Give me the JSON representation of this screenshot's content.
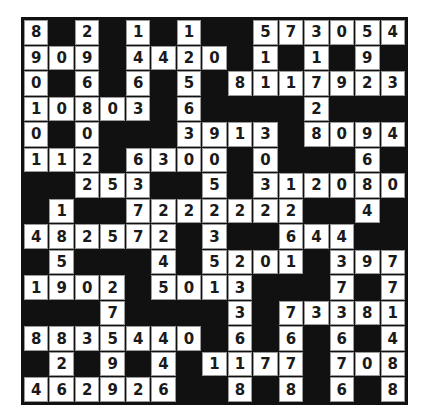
{
  "puzzle": {
    "type": "number-crossword",
    "rows": 15,
    "cols": 15,
    "colors": {
      "block": "#111111",
      "cell": "#ffffff",
      "digit": "#1a1a1a"
    },
    "grid": [
      [
        "8",
        "#",
        "2",
        "#",
        "1",
        "#",
        "1",
        "#",
        "#",
        "5",
        "7",
        "3",
        "0",
        "5",
        "4"
      ],
      [
        "9",
        "0",
        "9",
        "#",
        "4",
        "4",
        "2",
        "0",
        "#",
        "1",
        "#",
        "1",
        "#",
        "9",
        "#"
      ],
      [
        "0",
        "#",
        "6",
        "#",
        "6",
        "#",
        "5",
        "#",
        "8",
        "1",
        "1",
        "7",
        "9",
        "2",
        "3"
      ],
      [
        "1",
        "0",
        "8",
        "0",
        "3",
        "#",
        "6",
        "#",
        "#",
        "#",
        "#",
        "2",
        "#",
        "#",
        "#"
      ],
      [
        "0",
        "#",
        "0",
        "#",
        "#",
        "#",
        "3",
        "9",
        "1",
        "3",
        "#",
        "8",
        "0",
        "9",
        "4"
      ],
      [
        "1",
        "1",
        "2",
        "#",
        "6",
        "3",
        "0",
        "0",
        "#",
        "0",
        "#",
        "#",
        "#",
        "6",
        "#"
      ],
      [
        "#",
        "#",
        "2",
        "5",
        "3",
        "#",
        "#",
        "5",
        "#",
        "3",
        "1",
        "2",
        "0",
        "8",
        "0"
      ],
      [
        "#",
        "1",
        "#",
        "#",
        "7",
        "2",
        "2",
        "2",
        "2",
        "2",
        "2",
        "#",
        "#",
        "4",
        "#"
      ],
      [
        "4",
        "8",
        "2",
        "5",
        "7",
        "2",
        "#",
        "3",
        "#",
        "#",
        "6",
        "4",
        "4",
        "#",
        "#"
      ],
      [
        "#",
        "5",
        "#",
        "#",
        "#",
        "4",
        "#",
        "5",
        "2",
        "0",
        "1",
        "#",
        "3",
        "9",
        "7"
      ],
      [
        "1",
        "9",
        "0",
        "2",
        "#",
        "5",
        "0",
        "1",
        "3",
        "#",
        "#",
        "#",
        "7",
        "#",
        "7"
      ],
      [
        "#",
        "#",
        "#",
        "7",
        "#",
        "#",
        "#",
        "#",
        "3",
        "#",
        "7",
        "3",
        "3",
        "8",
        "1"
      ],
      [
        "8",
        "8",
        "3",
        "5",
        "4",
        "4",
        "0",
        "#",
        "6",
        "#",
        "6",
        "#",
        "6",
        "#",
        "4"
      ],
      [
        "#",
        "2",
        "#",
        "9",
        "#",
        "4",
        "#",
        "1",
        "1",
        "7",
        "7",
        "#",
        "7",
        "0",
        "8"
      ],
      [
        "4",
        "6",
        "2",
        "9",
        "2",
        "6",
        "#",
        "#",
        "8",
        "#",
        "8",
        "#",
        "6",
        "#",
        "8"
      ]
    ]
  }
}
